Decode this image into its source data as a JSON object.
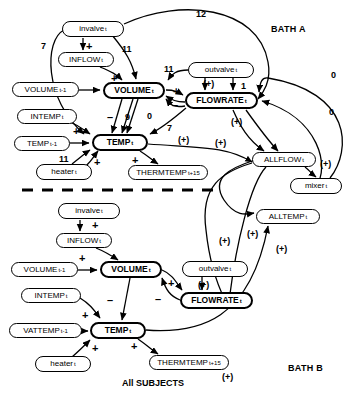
{
  "figure": {
    "caption": "All SUBJECTS",
    "panels": [
      {
        "name": "bath-a",
        "label": "BATH A"
      },
      {
        "name": "bath-b",
        "label": "BATH B"
      }
    ],
    "divider": "dashed-horizontal"
  },
  "bath_a": {
    "nodes": [
      {
        "id": "invalve",
        "base": "invalve",
        "sub": "t",
        "style": "thin",
        "x": 62,
        "y": 21,
        "w": 62,
        "h": 16
      },
      {
        "id": "inflow",
        "base": "INFLOW",
        "sub": "t",
        "style": "thin",
        "x": 58,
        "y": 52,
        "w": 56,
        "h": 15
      },
      {
        "id": "volume_prev",
        "base": "VOLUME",
        "sub": "t-1",
        "style": "thin",
        "x": 12,
        "y": 82,
        "w": 67,
        "h": 15
      },
      {
        "id": "volume",
        "base": "VOLUME",
        "sub": "t",
        "style": "bold",
        "x": 103,
        "y": 82,
        "w": 62,
        "h": 17
      },
      {
        "id": "outvalve",
        "base": "outvalve",
        "sub": "t",
        "style": "thin",
        "x": 188,
        "y": 62,
        "w": 66,
        "h": 16
      },
      {
        "id": "flowrate",
        "base": "FLOWRATE",
        "sub": "t",
        "style": "bold",
        "x": 185,
        "y": 92,
        "w": 73,
        "h": 17
      },
      {
        "id": "intemp",
        "base": "INTEMP",
        "sub": "t",
        "style": "thin",
        "x": 17,
        "y": 109,
        "w": 60,
        "h": 15
      },
      {
        "id": "temp_prev",
        "base": "TEMP",
        "sub": "t-1",
        "style": "thin",
        "x": 14,
        "y": 136,
        "w": 56,
        "h": 15
      },
      {
        "id": "temp",
        "base": "TEMP",
        "sub": "t",
        "style": "bold",
        "x": 92,
        "y": 134,
        "w": 56,
        "h": 17
      },
      {
        "id": "heater",
        "base": "heater",
        "sub": "t",
        "style": "thin",
        "x": 36,
        "y": 164,
        "w": 56,
        "h": 16
      },
      {
        "id": "thermtemp",
        "base": "THERMTEMP",
        "sub": "t+15",
        "style": "thin",
        "x": 128,
        "y": 165,
        "w": 80,
        "h": 15
      },
      {
        "id": "allflow",
        "base": "ALLFLOW",
        "sub": "t",
        "style": "thin",
        "x": 252,
        "y": 152,
        "w": 64,
        "h": 15
      },
      {
        "id": "mixer",
        "base": "mixer",
        "sub": "t",
        "style": "thin",
        "x": 290,
        "y": 178,
        "w": 52,
        "h": 16
      }
    ],
    "edge_labels": [
      {
        "text": "12",
        "x": 196,
        "y": 10
      },
      {
        "text": "7",
        "x": 41,
        "y": 42
      },
      {
        "text": "11",
        "x": 122,
        "y": 45
      },
      {
        "text": "11",
        "x": 164,
        "y": 65
      },
      {
        "text": "1",
        "x": 241,
        "y": 82
      },
      {
        "text": "0",
        "x": 331,
        "y": 71
      },
      {
        "text": "0",
        "x": 329,
        "y": 108
      },
      {
        "text": "0",
        "x": 147,
        "y": 112
      },
      {
        "text": "9",
        "x": 125,
        "y": 113
      },
      {
        "text": "7",
        "x": 167,
        "y": 124
      },
      {
        "text": "11",
        "x": 59,
        "y": 155
      }
    ],
    "signs": [
      {
        "text": "+",
        "x": 86,
        "y": 41
      },
      {
        "text": "+",
        "x": 111,
        "y": 73
      },
      {
        "text": "+",
        "x": 173,
        "y": 86
      },
      {
        "text": "(+)",
        "x": 203,
        "y": 80
      },
      {
        "text": "–",
        "x": 172,
        "y": 100
      },
      {
        "text": "–",
        "x": 107,
        "y": 112
      },
      {
        "text": "+",
        "x": 73,
        "y": 126
      },
      {
        "text": "+",
        "x": 94,
        "y": 157
      },
      {
        "text": "+",
        "x": 132,
        "y": 155
      },
      {
        "text": "(+)",
        "x": 178,
        "y": 136
      },
      {
        "text": "(+)",
        "x": 231,
        "y": 118
      },
      {
        "text": "(+)",
        "x": 215,
        "y": 139
      },
      {
        "text": "(+)",
        "x": 320,
        "y": 160
      }
    ]
  },
  "bath_b": {
    "nodes": [
      {
        "id": "invalve_b",
        "base": "invalve",
        "sub": "t",
        "style": "thin",
        "x": 58,
        "y": 203,
        "w": 62,
        "h": 16
      },
      {
        "id": "inflow_b",
        "base": "INFLOW",
        "sub": "t",
        "style": "thin",
        "x": 56,
        "y": 233,
        "w": 56,
        "h": 15
      },
      {
        "id": "volume_prev_b",
        "base": "VOLUME",
        "sub": "t-1",
        "style": "thin",
        "x": 11,
        "y": 262,
        "w": 67,
        "h": 15
      },
      {
        "id": "volume_b",
        "base": "VOLUME",
        "sub": "t",
        "style": "bold",
        "x": 100,
        "y": 261,
        "w": 62,
        "h": 17
      },
      {
        "id": "outvalve_b",
        "base": "outvalve",
        "sub": "t",
        "style": "thin",
        "x": 182,
        "y": 261,
        "w": 66,
        "h": 16
      },
      {
        "id": "flowrate_b",
        "base": "FLOWRATE",
        "sub": "t",
        "style": "bold",
        "x": 180,
        "y": 292,
        "w": 73,
        "h": 17
      },
      {
        "id": "intemp_b",
        "base": "INTEMP",
        "sub": "t",
        "style": "thin",
        "x": 21,
        "y": 288,
        "w": 60,
        "h": 15
      },
      {
        "id": "vattemp_prev",
        "base": "VATTEMP",
        "sub": "t-1",
        "style": "thin",
        "x": 9,
        "y": 323,
        "w": 73,
        "h": 15
      },
      {
        "id": "temp_b",
        "base": "TEMP",
        "sub": "t",
        "style": "bold",
        "x": 90,
        "y": 322,
        "w": 56,
        "h": 17
      },
      {
        "id": "heater_b",
        "base": "heater",
        "sub": "t",
        "style": "thin",
        "x": 35,
        "y": 356,
        "w": 56,
        "h": 16
      },
      {
        "id": "thermtemp_b",
        "base": "THERMTEMP",
        "sub": "t+15",
        "style": "thin",
        "x": 149,
        "y": 355,
        "w": 80,
        "h": 15
      },
      {
        "id": "alltemp",
        "base": "ALLTEMP",
        "sub": "t",
        "style": "thin",
        "x": 256,
        "y": 209,
        "w": 64,
        "h": 15
      }
    ],
    "edge_labels": [],
    "signs": [
      {
        "text": "+",
        "x": 92,
        "y": 220
      },
      {
        "text": "+",
        "x": 79,
        "y": 253
      },
      {
        "text": "+",
        "x": 168,
        "y": 278
      },
      {
        "text": "(+)",
        "x": 198,
        "y": 281
      },
      {
        "text": "–",
        "x": 107,
        "y": 295
      },
      {
        "text": "–",
        "x": 155,
        "y": 294
      },
      {
        "text": "+",
        "x": 82,
        "y": 310
      },
      {
        "text": "+",
        "x": 92,
        "y": 343
      },
      {
        "text": "+",
        "x": 131,
        "y": 341
      },
      {
        "text": "(+)",
        "x": 219,
        "y": 237
      },
      {
        "text": "(+)",
        "x": 247,
        "y": 230
      },
      {
        "text": "(+)",
        "x": 276,
        "y": 245
      },
      {
        "text": "(+)",
        "x": 222,
        "y": 373
      }
    ]
  },
  "labels": {
    "bath_a": "BATH A",
    "bath_b": "BATH B",
    "all_subjects": "All SUBJECTS"
  }
}
